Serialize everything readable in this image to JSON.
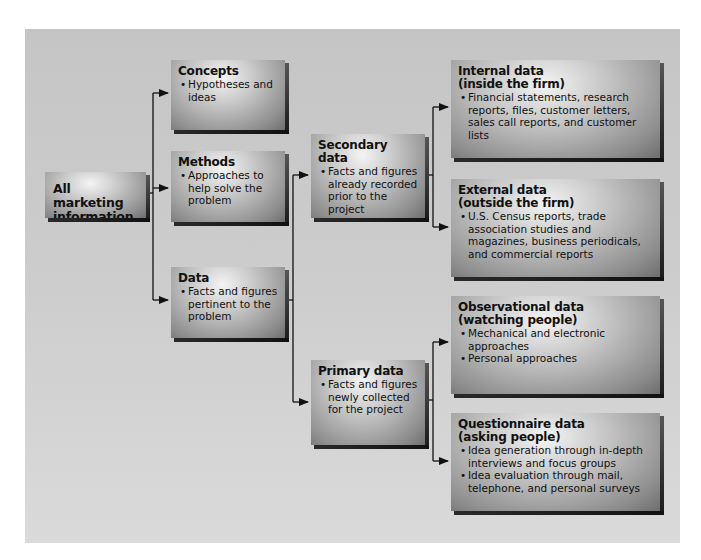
{
  "diagram": {
    "type": "hierarchy-flowchart",
    "root": {
      "title": "All marketing information"
    },
    "level1": [
      {
        "id": "concepts",
        "title": "Concepts",
        "bullets": [
          "Hypotheses and ideas"
        ]
      },
      {
        "id": "methods",
        "title": "Methods",
        "bullets": [
          "Approaches to help solve the problem"
        ]
      },
      {
        "id": "data",
        "title": "Data",
        "bullets": [
          "Facts and figures pertinent to the problem"
        ]
      }
    ],
    "level2": [
      {
        "id": "secondary",
        "parent": "data",
        "title": "Secondary data",
        "bullets": [
          "Facts and figures already recorded prior to the project"
        ]
      },
      {
        "id": "primary",
        "parent": "data",
        "title": "Primary data",
        "bullets": [
          "Facts and figures newly collected for the project"
        ]
      }
    ],
    "level3": [
      {
        "id": "internal",
        "parent": "secondary",
        "title": "Internal data",
        "subtitle": "(inside the firm)",
        "bullets": [
          "Financial statements, research reports, files, customer letters, sales call reports, and customer lists"
        ]
      },
      {
        "id": "external",
        "parent": "secondary",
        "title": "External data",
        "subtitle": "(outside the firm)",
        "bullets": [
          "U.S. Census reports, trade association studies and magazines, business periodicals, and commercial reports"
        ]
      },
      {
        "id": "observational",
        "parent": "primary",
        "title": "Observational data",
        "subtitle": "(watching people)",
        "bullets": [
          "Mechanical and electronic approaches",
          "Personal approaches"
        ]
      },
      {
        "id": "questionnaire",
        "parent": "primary",
        "title": "Questionnaire data",
        "subtitle": "(asking people)",
        "bullets": [
          "Idea generation through in-depth interviews and focus groups",
          "Idea evaluation through mail, telephone, and personal surveys"
        ]
      }
    ],
    "edges": [
      [
        "root",
        "concepts"
      ],
      [
        "root",
        "methods"
      ],
      [
        "root",
        "data"
      ],
      [
        "data",
        "secondary"
      ],
      [
        "data",
        "primary"
      ],
      [
        "secondary",
        "internal"
      ],
      [
        "secondary",
        "external"
      ],
      [
        "primary",
        "observational"
      ],
      [
        "primary",
        "questionnaire"
      ]
    ]
  },
  "colors": {
    "panel_background": "#cbcbcb",
    "box_highlight": "#f4f4f4",
    "box_shadow": "#1a1a1a",
    "text": "#111111",
    "connector": "#111111"
  }
}
